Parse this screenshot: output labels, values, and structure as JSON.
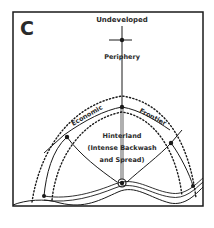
{
  "panel_letter": "C",
  "labels": {
    "top": "Undeveloped",
    "periphery": "Periphery",
    "frontier_left": "Economic",
    "frontier_right": "Frontier",
    "hinterland_1": "Hinterland",
    "hinterland_2": "(Intense Backwash",
    "hinterland_3": "and Spread)"
  },
  "colors": {
    "ink": "#1a1a1a",
    "background": "#ffffff"
  }
}
